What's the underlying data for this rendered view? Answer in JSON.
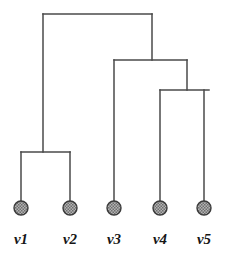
{
  "figure": {
    "type": "dendrogram",
    "title": "",
    "background_color": "#ffffff",
    "line_color": "#4a4a4a",
    "line_width": 1.5,
    "node_fill_color": "#9a9a9a",
    "node_stroke_color": "#3a3a3a",
    "node_radius": 7,
    "label_color": "#161616"
  },
  "leaves": [
    {
      "id": "v1",
      "label": "v1",
      "x": 21,
      "y": 208,
      "label_y": 232
    },
    {
      "id": "v2",
      "label": "v2",
      "x": 70,
      "y": 208,
      "label_y": 232
    },
    {
      "id": "v3",
      "label": "v3",
      "x": 114,
      "y": 208,
      "label_y": 232
    },
    {
      "id": "v4",
      "label": "v4",
      "x": 160,
      "y": 208,
      "label_y": 232
    },
    {
      "id": "v5",
      "label": "v5",
      "x": 204,
      "y": 208,
      "label_y": 232
    }
  ],
  "internal_nodes": [
    {
      "id": "n_v1_v2",
      "children": [
        "v1",
        "v2"
      ],
      "merge_height_y": 152,
      "left_x": 21,
      "right_x": 70,
      "connector_x": 43
    },
    {
      "id": "n_v4_v5",
      "children": [
        "v4",
        "v5"
      ],
      "merge_height_y": 90,
      "left_x": 160,
      "right_x": 209,
      "connector_x": 187
    },
    {
      "id": "n_v3_v4v5",
      "children": [
        "v3",
        "n_v4_v5"
      ],
      "merge_height_y": 60,
      "left_x": 114,
      "right_x": 187,
      "connector_x": 152
    },
    {
      "id": "n_root",
      "children": [
        "n_v1_v2",
        "n_v3_v4v5"
      ],
      "merge_height_y": 14,
      "left_x": 43,
      "right_x": 152,
      "connector_x": 97
    }
  ],
  "chart_data": {
    "type": "tree",
    "title": "",
    "xlabel": "",
    "ylabel": "",
    "categories": [
      "v1",
      "v2",
      "v3",
      "v4",
      "v5"
    ],
    "merge_order": [
      {
        "step": 1,
        "merged": [
          "v4",
          "v5"
        ],
        "height_px_from_top": 90
      },
      {
        "step": 2,
        "merged": [
          "v3",
          "(v4,v5)"
        ],
        "height_px_from_top": 60
      },
      {
        "step": 3,
        "merged": [
          "v1",
          "v2"
        ],
        "height_px_from_top": 152
      },
      {
        "step": 4,
        "merged": [
          "(v1,v2)",
          "(v3,(v4,v5))"
        ],
        "height_px_from_top": 14
      }
    ],
    "newick": "((v1,v2),(v3,(v4,v5)));",
    "grid": false,
    "legend": "none"
  }
}
